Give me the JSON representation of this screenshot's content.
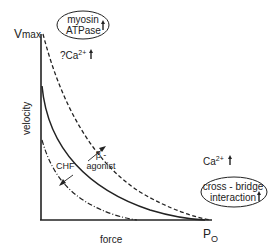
{
  "diagram": {
    "axes": {
      "y_label": "velocity",
      "x_label": "force",
      "y_max_label": "V",
      "y_max_sub": "max",
      "x_max_label": "P",
      "x_max_sub": "O"
    },
    "annotations": {
      "top_ellipse": {
        "line1": "myosin",
        "line2": "ATPase",
        "arrow": "up"
      },
      "top_ca": {
        "prefix": "?",
        "text": "Ca",
        "sup": "2+",
        "arrow": "up"
      },
      "right_ca": {
        "text": "Ca",
        "sup": "2+",
        "arrow": "up"
      },
      "right_ellipse": {
        "line1": "cross - bridge",
        "line2": "interaction",
        "arrow": "up"
      },
      "beta_label_1": "β -",
      "beta_label_2": "agonist",
      "chf_label": "CHF"
    },
    "curves": [
      {
        "name": "beta-agonist",
        "style": "dashed"
      },
      {
        "name": "normal",
        "style": "solid"
      },
      {
        "name": "CHF",
        "style": "dash-dot"
      }
    ]
  }
}
